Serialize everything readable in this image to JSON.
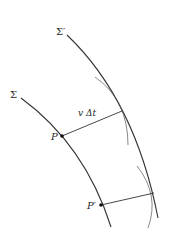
{
  "diagram": {
    "colors": {
      "stroke": "#333333",
      "thin_stroke": "#555555",
      "background": "#ffffff"
    },
    "labels": {
      "sigma_prime": "Σ′",
      "sigma": "Σ",
      "v_delta_t": "v Δt",
      "p": "P",
      "p_prime": "P′"
    },
    "curves": {
      "sigma_prime": {
        "path": "M 67 35 Q 135 100 158 218"
      },
      "sigma": {
        "path": "M 21 98 Q 85 145 111 227"
      },
      "wavelet_1": {
        "path": "M 95 77 Q 128 100 128 145"
      },
      "wavelet_2": {
        "path": "M 137 166 Q 160 195 148 228"
      }
    },
    "segments": {
      "v_delta_t": {
        "x1": 62,
        "y1": 136,
        "x2": 122,
        "y2": 111
      },
      "p_prime_ray": {
        "x1": 101,
        "y1": 205,
        "x2": 154,
        "y2": 193
      }
    },
    "points": {
      "p": {
        "cx": 62,
        "cy": 136
      },
      "p_prime": {
        "cx": 101,
        "cy": 205
      }
    }
  }
}
